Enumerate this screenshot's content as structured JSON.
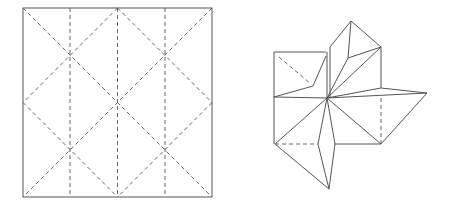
{
  "figure": {
    "left_panel": {
      "name": "crease-pattern-square",
      "description": "Square crease pattern with three vertical valley folds and diagonal diamond creases"
    },
    "right_panel": {
      "name": "folded-star-base",
      "description": "Folded base showing radiating flaps from a central point"
    }
  }
}
